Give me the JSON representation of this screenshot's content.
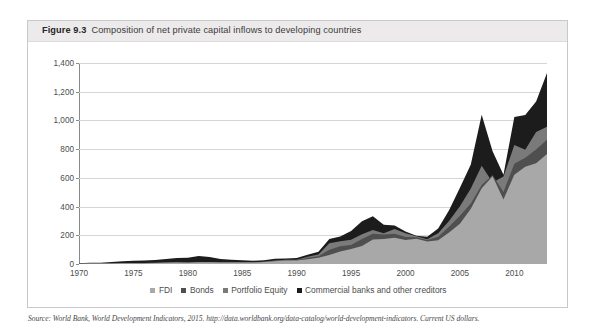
{
  "figure": {
    "number": "Figure 9.3",
    "title": "Composition of net private capital inflows to developing countries"
  },
  "source": {
    "text": "Source: World Bank, World Development Indicators, 2015. http://data.worldbank.org/data-catalog/world-development-indicators. Current US dollars."
  },
  "legend": {
    "items": [
      {
        "label": "FDI",
        "color": "#a8a8a8"
      },
      {
        "label": "Bonds",
        "color": "#4f4f4f"
      },
      {
        "label": "Portfolio Equity",
        "color": "#7a7a7a"
      },
      {
        "label": "Commercial banks and other creditors",
        "color": "#1c1c1c"
      }
    ]
  },
  "chart_data": {
    "type": "area",
    "stacked": true,
    "title": "Composition of net private capital inflows to developing countries",
    "xlabel": "",
    "ylabel": "",
    "xlim": [
      1970,
      2013
    ],
    "ylim": [
      0,
      1400
    ],
    "grid": true,
    "legend_position": "bottom",
    "units": "Current US dollars (billions)",
    "xticks": [
      1970,
      1975,
      1980,
      1985,
      1990,
      1995,
      2000,
      2005,
      2010
    ],
    "xtick_labels": [
      "1970",
      "1975",
      "1980",
      "1985",
      "1990",
      "1995",
      "2000",
      "2005",
      "2010"
    ],
    "yticks": [
      0,
      200,
      400,
      600,
      800,
      1000,
      1200,
      1400
    ],
    "ytick_labels": [
      "0",
      "200",
      "400",
      "600",
      "800",
      "1,000",
      "1,200",
      "1,400"
    ],
    "x": [
      1970,
      1971,
      1972,
      1973,
      1974,
      1975,
      1976,
      1977,
      1978,
      1979,
      1980,
      1981,
      1982,
      1983,
      1984,
      1985,
      1986,
      1987,
      1988,
      1989,
      1990,
      1991,
      1992,
      1993,
      1994,
      1995,
      1996,
      1997,
      1998,
      1999,
      2000,
      2001,
      2002,
      2003,
      2004,
      2005,
      2006,
      2007,
      2008,
      2009,
      2010,
      2011,
      2012,
      2013
    ],
    "series": [
      {
        "name": "FDI",
        "color": "#a8a8a8",
        "values": [
          2,
          3,
          3,
          4,
          5,
          6,
          6,
          7,
          9,
          11,
          9,
          13,
          13,
          10,
          11,
          11,
          10,
          14,
          20,
          24,
          24,
          33,
          44,
          63,
          87,
          104,
          125,
          170,
          175,
          183,
          168,
          176,
          157,
          165,
          219,
          281,
          384,
          528,
          611,
          450,
          622,
          678,
          702,
          766
        ]
      },
      {
        "name": "Bonds",
        "color": "#4f4f4f",
        "values": [
          0,
          0,
          0,
          1,
          1,
          1,
          1,
          1,
          1,
          2,
          1,
          1,
          1,
          1,
          1,
          3,
          2,
          1,
          2,
          2,
          2,
          11,
          10,
          37,
          37,
          29,
          50,
          40,
          31,
          27,
          20,
          11,
          10,
          25,
          40,
          55,
          38,
          22,
          9,
          51,
          76,
          62,
          95,
          100
        ]
      },
      {
        "name": "Portfolio Equity",
        "color": "#7a7a7a",
        "values": [
          0,
          0,
          0,
          0,
          0,
          0,
          0,
          0,
          0,
          0,
          0,
          0,
          0,
          0,
          0,
          0,
          0,
          1,
          3,
          3,
          3,
          7,
          13,
          45,
          35,
          36,
          33,
          26,
          8,
          34,
          26,
          6,
          6,
          25,
          41,
          67,
          104,
          135,
          -52,
          109,
          130,
          55,
          122,
          90
        ]
      },
      {
        "name": "Commercial banks and other creditors",
        "color": "#1c1c1c",
        "values": [
          4,
          5,
          6,
          9,
          13,
          16,
          17,
          19,
          24,
          29,
          33,
          42,
          35,
          24,
          18,
          12,
          11,
          10,
          12,
          10,
          13,
          13,
          18,
          30,
          32,
          60,
          90,
          97,
          60,
          25,
          12,
          4,
          17,
          33,
          74,
          128,
          167,
          355,
          218,
          11,
          196,
          243,
          213,
          374
        ]
      }
    ],
    "totals": [
      6,
      8,
      9,
      14,
      19,
      23,
      24,
      27,
      34,
      42,
      43,
      56,
      49,
      35,
      30,
      26,
      23,
      26,
      37,
      39,
      42,
      64,
      85,
      175,
      191,
      229,
      298,
      333,
      274,
      269,
      226,
      197,
      190,
      248,
      374,
      531,
      693,
      1040,
      786,
      621,
      1024,
      1038,
      1132,
      1330
    ]
  }
}
